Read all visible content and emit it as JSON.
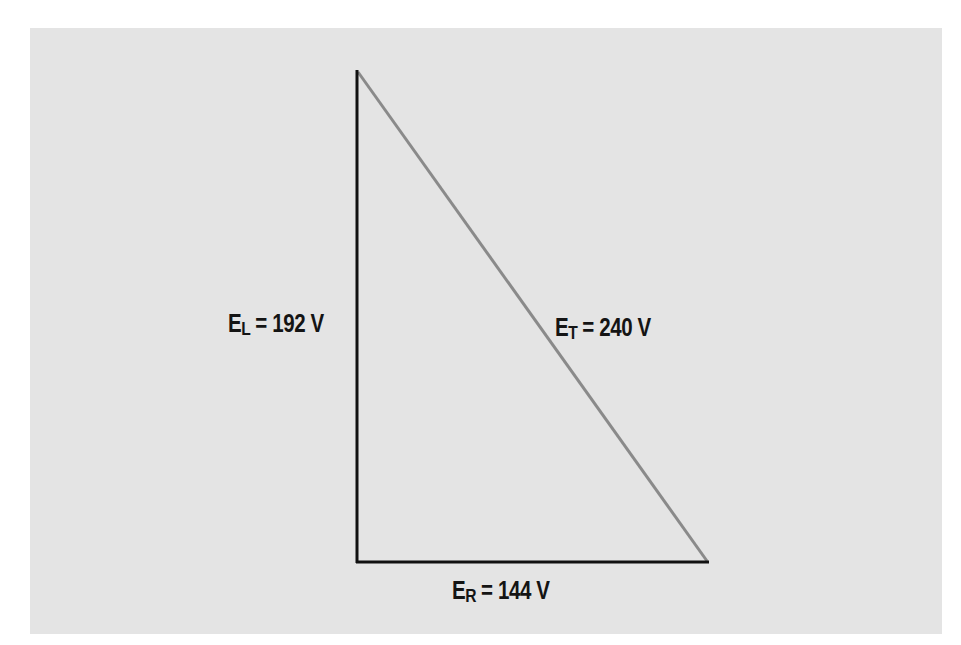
{
  "diagram": {
    "type": "voltage-triangle",
    "background_color": "#e4e4e4",
    "vertices": {
      "top": [
        357,
        70
      ],
      "right_angle": [
        357,
        562
      ],
      "bottom_right": [
        708,
        562
      ]
    },
    "sides": {
      "vertical": {
        "symbol": "E",
        "subscript": "L",
        "equals": "= 192 V",
        "value": 192,
        "unit": "V",
        "color": "#111111"
      },
      "horizontal": {
        "symbol": "E",
        "subscript": "R",
        "equals": "= 144 V",
        "value": 144,
        "unit": "V",
        "color": "#111111"
      },
      "hypotenuse": {
        "symbol": "E",
        "subscript": "T",
        "equals": "= 240 V",
        "value": 240,
        "unit": "V",
        "color": "#8a8a8a"
      }
    }
  }
}
